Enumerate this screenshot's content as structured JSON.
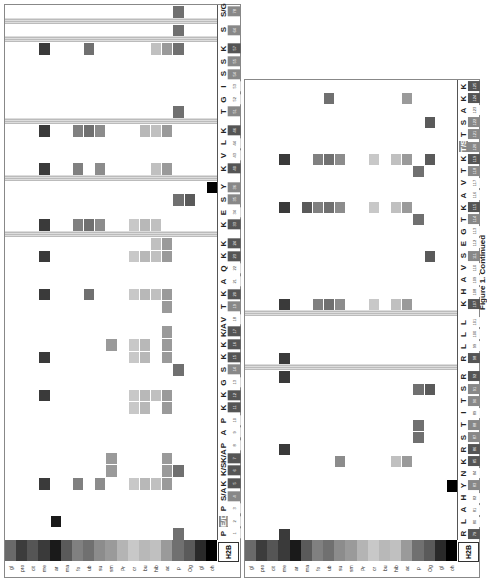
{
  "figure": {
    "caption": "Figure 1. Continued",
    "protein": "H2B"
  },
  "modifications": [
    "gl",
    "pro",
    "cit",
    "me",
    "ar",
    "ma",
    "fo",
    "ub",
    "su",
    "sm",
    "Pr",
    "cr",
    "bu",
    "hib",
    "ac",
    "p",
    "Og",
    "gl",
    "oh"
  ],
  "modification_colors": [
    "#6a6a6a",
    "#3c3c3c",
    "#555555",
    "#3a3a3a",
    "#1a1a1a",
    "#5a5a5a",
    "#808080",
    "#707070",
    "#8c8c8c",
    "#9a9a9a",
    "#b4b4b4",
    "#c8c8c8",
    "#b8b8b8",
    "#c0c0c0",
    "#9a9a9a",
    "#707070",
    "#5a5a5a",
    "#2a2a2a",
    "#000000"
  ],
  "left_panel": {
    "residues": [
      {
        "aa": "P",
        "num": "1"
      },
      {
        "aa": "E/D",
        "num": "2",
        "highlight": true
      },
      {
        "aa": "P",
        "num": "3"
      },
      {
        "aa": "S/A",
        "num": "4"
      },
      {
        "aa": "K",
        "num": "5"
      },
      {
        "aa": "K/S",
        "num": "6"
      },
      {
        "aa": "K/A",
        "num": "7"
      },
      {
        "aa": "P",
        "num": "8"
      },
      {
        "aa": "A",
        "num": "9"
      },
      {
        "aa": "P",
        "num": "10"
      },
      {
        "aa": "K",
        "num": "11"
      },
      {
        "aa": "K",
        "num": "12"
      },
      {
        "aa": "G",
        "num": "13"
      },
      {
        "aa": "S",
        "num": "14"
      },
      {
        "aa": "K",
        "num": "15"
      },
      {
        "aa": "K",
        "num": "16"
      },
      {
        "aa": "K/A",
        "num": "17"
      },
      {
        "aa": "V",
        "num": "18"
      },
      {
        "aa": "T",
        "num": "19"
      },
      {
        "aa": "K",
        "num": "20"
      },
      {
        "aa": "A",
        "num": "21"
      },
      {
        "aa": "Q",
        "num": "22"
      },
      {
        "aa": "K",
        "num": "23"
      },
      {
        "aa": "K",
        "num": "24"
      },
      {
        "aa": "K",
        "num": "33"
      },
      {
        "aa": "E",
        "num": "34"
      },
      {
        "aa": "S",
        "num": "35"
      },
      {
        "aa": "Y",
        "num": "36"
      },
      {
        "aa": "K",
        "num": "40"
      },
      {
        "aa": "V",
        "num": "43"
      },
      {
        "aa": "L",
        "num": "44"
      },
      {
        "aa": "K",
        "num": "46"
      },
      {
        "aa": "T",
        "num": "51"
      },
      {
        "aa": "G",
        "num": "52"
      },
      {
        "aa": "I",
        "num": "53"
      },
      {
        "aa": "S",
        "num": "54"
      },
      {
        "aa": "S",
        "num": "55"
      },
      {
        "aa": "K",
        "num": "57"
      },
      {
        "aa": "S",
        "num": "64"
      },
      {
        "aa": "S/G",
        "num": "78"
      }
    ],
    "gaps_after": [
      "24",
      "36",
      "46",
      "57",
      "64"
    ],
    "annotations": [
      "S6",
      "S6",
      "K7",
      "K17",
      "S78"
    ]
  },
  "right_panel": {
    "residues": [
      {
        "aa": "R",
        "num": "79"
      },
      {
        "aa": "L",
        "num": "80"
      },
      {
        "aa": "A",
        "num": "81"
      },
      {
        "aa": "H",
        "num": "82"
      },
      {
        "aa": "Y",
        "num": "83"
      },
      {
        "aa": "N",
        "num": "84"
      },
      {
        "aa": "K",
        "num": "85"
      },
      {
        "aa": "R",
        "num": "86"
      },
      {
        "aa": "S",
        "num": "87"
      },
      {
        "aa": "T",
        "num": "88"
      },
      {
        "aa": "I",
        "num": "89"
      },
      {
        "aa": "T",
        "num": "90"
      },
      {
        "aa": "S",
        "num": "91"
      },
      {
        "aa": "R",
        "num": "92"
      },
      {
        "aa": "R",
        "num": "98"
      },
      {
        "aa": "L",
        "num": "99"
      },
      {
        "aa": "L",
        "num": "100"
      },
      {
        "aa": "L",
        "num": "101"
      },
      {
        "aa": "K",
        "num": "107"
      },
      {
        "aa": "H",
        "num": "108"
      },
      {
        "aa": "A",
        "num": "109"
      },
      {
        "aa": "V",
        "num": "110"
      },
      {
        "aa": "S",
        "num": "111"
      },
      {
        "aa": "E",
        "num": "112"
      },
      {
        "aa": "G",
        "num": "113"
      },
      {
        "aa": "T",
        "num": "114"
      },
      {
        "aa": "K",
        "num": "115"
      },
      {
        "aa": "A",
        "num": "116"
      },
      {
        "aa": "V",
        "num": "117"
      },
      {
        "aa": "T",
        "num": "118"
      },
      {
        "aa": "K",
        "num": "119"
      },
      {
        "aa": "T/S",
        "num": "120",
        "highlight": true
      },
      {
        "aa": "T",
        "num": "121"
      },
      {
        "aa": "S",
        "num": "122"
      },
      {
        "aa": "A",
        "num": "123"
      },
      {
        "aa": "K",
        "num": "124"
      },
      {
        "aa": "K",
        "num": "125"
      }
    ],
    "gaps_after": [
      "92",
      "101"
    ]
  }
}
